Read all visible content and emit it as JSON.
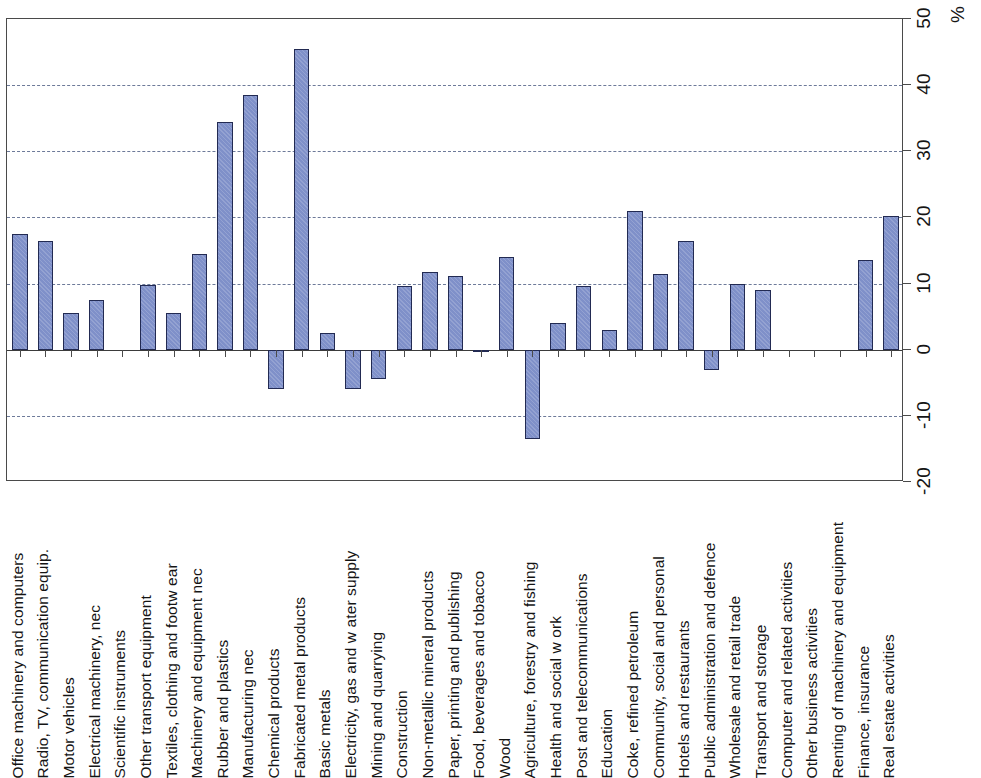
{
  "chart_data": {
    "type": "bar",
    "title": "",
    "subtitle": "",
    "xlabel": "",
    "ylabel": "%",
    "unit_label": "%",
    "orientation": "vertical-bars-with-rotated-category-labels",
    "grid": true,
    "gridlines_at": [
      -10,
      10,
      20,
      30,
      40
    ],
    "legend": null,
    "ylim": [
      -20,
      50
    ],
    "yticks": [
      -20,
      -10,
      0,
      10,
      20,
      30,
      40,
      50
    ],
    "ytick_labels": [
      "-20",
      "-10",
      "0",
      "10",
      "20",
      "30",
      "40",
      "50"
    ],
    "categories": [
      "Office machinery and computers",
      "Radio, TV, communication equip.",
      "Motor vehicles",
      "Electrical machinery, nec",
      "Scientific instruments",
      "Other transport equipment",
      "Textiles, clothing and footw ear",
      "Machinery and equipment nec",
      "Rubber and plastics",
      "Manufacturing nec",
      "Chemical products",
      "Fabricated metal products",
      "Basic metals",
      "Electricity, gas and w ater supply",
      "Mining and quarrying",
      "Construction",
      "Non-metallic mineral products",
      "Paper, printing and publishing",
      "Food, beverages and tobacco",
      "Wood",
      "Agriculture, forestry and fishing",
      "Health and social w ork",
      "Post and telecommunications",
      "Education",
      "Coke, refined petroleum",
      "Community, social and personal",
      "Hotels and restaurants",
      "Public administration and defence",
      "Wholesale and retail trade",
      "Transport and storage",
      "Computer and related activities",
      "Other business activities",
      "Renting of machinery and equipment",
      "Finance, insurance",
      "Real estate activities"
    ],
    "values": [
      17.5,
      16.5,
      5.5,
      7.5,
      0,
      9.8,
      5.5,
      14.5,
      34.5,
      38.5,
      -6.0,
      45.5,
      2.5,
      -6.0,
      -4.5,
      9.7,
      11.7,
      11.1,
      -0.4,
      14.0,
      -13.5,
      4.0,
      9.7,
      3.0,
      21.0,
      11.5,
      16.5,
      -3.0,
      10.0,
      9.0,
      0,
      0,
      0,
      13.5,
      20.2
    ],
    "series_color": "#7f90c9",
    "series_border_color": "#222a52"
  }
}
